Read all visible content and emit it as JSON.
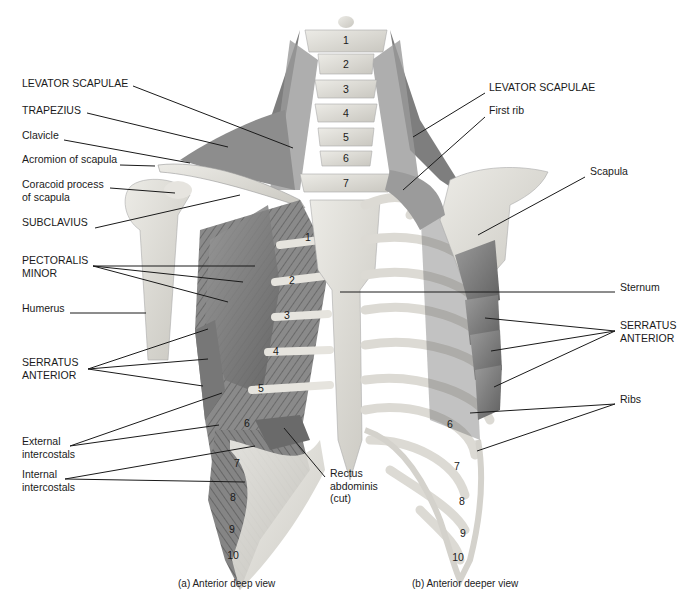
{
  "figure": {
    "captions": {
      "left": "(a) Anterior deep view",
      "right": "(b) Anterior deeper view"
    },
    "colors": {
      "background": "#ffffff",
      "bone": "#dedcd6",
      "bone_shade": "#c4c2bb",
      "muscle": "#8c8c8c",
      "muscle_dark": "#6e6e6e",
      "text": "#1a1a1a",
      "leader": "#1a1a1a"
    },
    "labels_left": [
      {
        "id": "levator-scapulae-left",
        "text": "LEVATOR SCAPULAE",
        "x": 22,
        "y": 83
      },
      {
        "id": "trapezius",
        "text": "TRAPEZIUS",
        "x": 22,
        "y": 110
      },
      {
        "id": "clavicle",
        "text": "Clavicle",
        "x": 22,
        "y": 135
      },
      {
        "id": "acromion",
        "text": "Acromion of scapula",
        "x": 22,
        "y": 159
      },
      {
        "id": "coracoid",
        "text": "Coracoid process\nof scapula",
        "x": 22,
        "y": 184
      },
      {
        "id": "subclavius",
        "text": "SUBCLAVIUS",
        "x": 22,
        "y": 222
      },
      {
        "id": "pectoralis-minor",
        "text": "PECTORALIS\nMINOR",
        "x": 22,
        "y": 260
      },
      {
        "id": "humerus",
        "text": "Humerus",
        "x": 22,
        "y": 308
      },
      {
        "id": "serratus-anterior-left",
        "text": "SERRATUS\nANTERIOR",
        "x": 22,
        "y": 362
      },
      {
        "id": "external-intercostals",
        "text": "External\nintercostals",
        "x": 22,
        "y": 441
      },
      {
        "id": "internal-intercostals",
        "text": "Internal\nintercostals",
        "x": 22,
        "y": 474
      },
      {
        "id": "rectus-abdominis",
        "text": "Rectus\nabdominis\n(cut)",
        "x": 330,
        "y": 473
      }
    ],
    "labels_right": [
      {
        "id": "levator-scapulae-right",
        "text": "LEVATOR SCAPULAE",
        "x": 489,
        "y": 87
      },
      {
        "id": "first-rib",
        "text": "First rib",
        "x": 489,
        "y": 110
      },
      {
        "id": "scapula",
        "text": "Scapula",
        "x": 590,
        "y": 171
      },
      {
        "id": "sternum",
        "text": "Sternum",
        "x": 620,
        "y": 287
      },
      {
        "id": "serratus-anterior-right",
        "text": "SERRATUS\nANTERIOR",
        "x": 620,
        "y": 325
      },
      {
        "id": "ribs",
        "text": "Ribs",
        "x": 620,
        "y": 399
      }
    ],
    "vertebra_numbers": [
      {
        "n": "1",
        "x": 346,
        "y": 40
      },
      {
        "n": "2",
        "x": 346,
        "y": 64
      },
      {
        "n": "3",
        "x": 346,
        "y": 89
      },
      {
        "n": "4",
        "x": 346,
        "y": 113
      },
      {
        "n": "5",
        "x": 346,
        "y": 137
      },
      {
        "n": "6",
        "x": 346,
        "y": 158
      },
      {
        "n": "7",
        "x": 346,
        "y": 183
      }
    ],
    "rib_numbers_left": [
      {
        "n": "1",
        "x": 308,
        "y": 237
      },
      {
        "n": "2",
        "x": 292,
        "y": 280
      },
      {
        "n": "3",
        "x": 287,
        "y": 315
      },
      {
        "n": "4",
        "x": 276,
        "y": 351
      },
      {
        "n": "5",
        "x": 261,
        "y": 388
      },
      {
        "n": "6",
        "x": 247,
        "y": 423
      },
      {
        "n": "7",
        "x": 237,
        "y": 463
      },
      {
        "n": "8",
        "x": 233,
        "y": 497
      },
      {
        "n": "9",
        "x": 232,
        "y": 529
      },
      {
        "n": "10",
        "x": 233,
        "y": 555
      }
    ],
    "rib_numbers_right": [
      {
        "n": "6",
        "x": 450,
        "y": 424
      },
      {
        "n": "7",
        "x": 457,
        "y": 466
      },
      {
        "n": "8",
        "x": 462,
        "y": 501
      },
      {
        "n": "9",
        "x": 463,
        "y": 533
      },
      {
        "n": "10",
        "x": 458,
        "y": 557
      }
    ],
    "leaders": [
      {
        "for": "levator-scapulae-left",
        "x1": 133,
        "y1": 86,
        "x2": 293,
        "y2": 148
      },
      {
        "for": "trapezius",
        "x1": 87,
        "y1": 113,
        "x2": 228,
        "y2": 147
      },
      {
        "for": "clavicle",
        "x1": 64,
        "y1": 140,
        "x2": 190,
        "y2": 163
      },
      {
        "for": "acromion",
        "x1": 120,
        "y1": 165,
        "x2": 155,
        "y2": 166
      },
      {
        "for": "coracoid",
        "x1": 110,
        "y1": 188,
        "x2": 175,
        "y2": 193
      },
      {
        "for": "subclavius",
        "x1": 95,
        "y1": 228,
        "x2": 240,
        "y2": 195
      },
      {
        "for": "pectoralis-minor-1",
        "x1": 93,
        "y1": 266,
        "x2": 255,
        "y2": 266
      },
      {
        "for": "pectoralis-minor-2",
        "x1": 93,
        "y1": 266,
        "x2": 243,
        "y2": 282
      },
      {
        "for": "pectoralis-minor-3",
        "x1": 93,
        "y1": 266,
        "x2": 228,
        "y2": 302
      },
      {
        "for": "humerus",
        "x1": 70,
        "y1": 313,
        "x2": 146,
        "y2": 313
      },
      {
        "for": "serratus-left-1",
        "x1": 88,
        "y1": 369,
        "x2": 208,
        "y2": 329
      },
      {
        "for": "serratus-left-2",
        "x1": 88,
        "y1": 369,
        "x2": 208,
        "y2": 359
      },
      {
        "for": "serratus-left-3",
        "x1": 88,
        "y1": 369,
        "x2": 203,
        "y2": 386
      },
      {
        "for": "external-intercostals-1",
        "x1": 70,
        "y1": 446,
        "x2": 222,
        "y2": 393
      },
      {
        "for": "external-intercostals-2",
        "x1": 70,
        "y1": 446,
        "x2": 219,
        "y2": 425
      },
      {
        "for": "internal-intercostals-1",
        "x1": 65,
        "y1": 479,
        "x2": 255,
        "y2": 446
      },
      {
        "for": "internal-intercostals-2",
        "x1": 65,
        "y1": 479,
        "x2": 245,
        "y2": 482
      },
      {
        "for": "rectus-abdominis",
        "x1": 325,
        "y1": 477,
        "x2": 284,
        "y2": 428
      },
      {
        "for": "levator-scapulae-right",
        "x1": 485,
        "y1": 93,
        "x2": 413,
        "y2": 137
      },
      {
        "for": "first-rib",
        "x1": 485,
        "y1": 117,
        "x2": 403,
        "y2": 190
      },
      {
        "for": "scapula",
        "x1": 585,
        "y1": 177,
        "x2": 478,
        "y2": 235
      },
      {
        "for": "sternum",
        "x1": 615,
        "y1": 292,
        "x2": 340,
        "y2": 292
      },
      {
        "for": "serratus-right-1",
        "x1": 615,
        "y1": 331,
        "x2": 485,
        "y2": 318
      },
      {
        "for": "serratus-right-2",
        "x1": 615,
        "y1": 331,
        "x2": 491,
        "y2": 351
      },
      {
        "for": "serratus-right-3",
        "x1": 615,
        "y1": 331,
        "x2": 494,
        "y2": 387
      },
      {
        "for": "ribs-1",
        "x1": 615,
        "y1": 404,
        "x2": 470,
        "y2": 413
      },
      {
        "for": "ribs-2",
        "x1": 615,
        "y1": 404,
        "x2": 477,
        "y2": 451
      }
    ]
  }
}
